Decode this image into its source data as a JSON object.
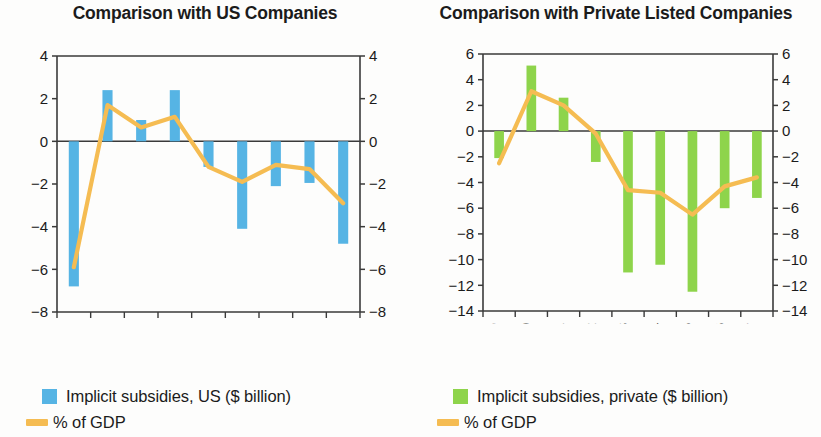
{
  "colors": {
    "bar_us": "#56b4e4",
    "bar_private": "#8ed44b",
    "line": "#f5bc52",
    "axis": "#3a3a3a",
    "text": "#1b1b1b",
    "background": "#fdfdfc"
  },
  "panels": {
    "left": {
      "title": "Comparison with US Companies",
      "legend": {
        "bar_label": "Implicit subsidies, US ($ billion)",
        "line_label": "% of GDP"
      }
    },
    "right": {
      "title": "Comparison with Private Listed Companies",
      "legend": {
        "bar_label": "Implicit subsidies, private ($ billion)",
        "line_label": "% of GDP"
      }
    }
  },
  "chart_data": [
    {
      "type": "bar",
      "title": "Comparison with US Companies",
      "xlabel": "",
      "ylabel": "",
      "ylim": [
        -8,
        4
      ],
      "yticks": [
        4,
        2,
        0,
        -2,
        -4,
        -6,
        -8
      ],
      "ytick_labels": [
        "4",
        "2",
        "0",
        "-2",
        "-4",
        "-6",
        "-8"
      ],
      "right_axis_mirrored": true,
      "grid": false,
      "legend_position": "below",
      "categories": [
        "2009",
        "2010",
        "2011",
        "2012",
        "2013",
        "2014",
        "2015",
        "2016",
        "2017"
      ],
      "series": [
        {
          "name": "Implicit subsidies, US ($ billion)",
          "type": "bar",
          "color": "#56b4e4",
          "values": [
            -6.8,
            2.4,
            1.0,
            2.4,
            -1.2,
            -4.1,
            -2.1,
            -1.95,
            -4.8
          ]
        },
        {
          "name": "% of GDP",
          "type": "line",
          "color": "#f5bc52",
          "values": [
            -5.9,
            1.7,
            0.65,
            1.15,
            -1.2,
            -1.9,
            -1.1,
            -1.3,
            -2.9
          ]
        }
      ]
    },
    {
      "type": "bar",
      "title": "Comparison with Private Listed Companies",
      "xlabel": "",
      "ylabel": "",
      "ylim": [
        -14,
        6
      ],
      "yticks": [
        6,
        4,
        2,
        0,
        -2,
        -4,
        -6,
        -8,
        -10,
        -12,
        -14
      ],
      "ytick_labels": [
        "6",
        "4",
        "2",
        "0",
        "-2",
        "-4",
        "-6",
        "-8",
        "-10",
        "-12",
        "-14"
      ],
      "right_axis_mirrored": true,
      "grid": false,
      "legend_position": "below",
      "categories": [
        "2009",
        "2010",
        "2011",
        "2012",
        "2013",
        "2014",
        "2015",
        "2016",
        "2017"
      ],
      "series": [
        {
          "name": "Implicit subsidies, private ($ billion)",
          "type": "bar",
          "color": "#8ed44b",
          "values": [
            -2.1,
            5.1,
            2.6,
            -2.4,
            -11.0,
            -10.4,
            -12.5,
            -6.0,
            -5.2
          ]
        },
        {
          "name": "% of GDP",
          "type": "line",
          "color": "#f5bc52",
          "values": [
            -2.5,
            3.1,
            2.0,
            -0.2,
            -4.6,
            -4.8,
            -6.5,
            -4.3,
            -3.6
          ]
        }
      ]
    }
  ]
}
